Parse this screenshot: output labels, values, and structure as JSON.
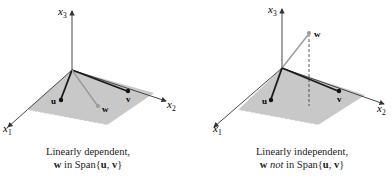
{
  "panels": [
    {
      "id": "dependent",
      "axes": {
        "x1": "x",
        "x1_sub": "1",
        "x2": "x",
        "x2_sub": "2",
        "x3": "x",
        "x3_sub": "3"
      },
      "vectors": {
        "u": "u",
        "v": "v",
        "w": "w"
      },
      "caption_line1": "Linearly dependent,",
      "caption_line2_bold": "w",
      "caption_line2_rest": " in Span{",
      "caption_span_u": "u",
      "caption_comma": ", ",
      "caption_span_v": "v",
      "caption_close": "}"
    },
    {
      "id": "independent",
      "axes": {
        "x1": "x",
        "x1_sub": "1",
        "x2": "x",
        "x2_sub": "2",
        "x3": "x",
        "x3_sub": "3"
      },
      "vectors": {
        "u": "u",
        "v": "v",
        "w": "w"
      },
      "caption_line1": "Linearly independent,",
      "caption_line2_bold": "w",
      "caption_not": "not",
      "caption_line2_rest": " in Span{",
      "caption_span_u": "u",
      "caption_comma": ", ",
      "caption_span_v": "v",
      "caption_close": "}"
    }
  ],
  "colors": {
    "plane": "#c8c8c8",
    "axis": "#333333",
    "vector": "#1a1a1a",
    "w_vector": "#9a9a9a"
  }
}
